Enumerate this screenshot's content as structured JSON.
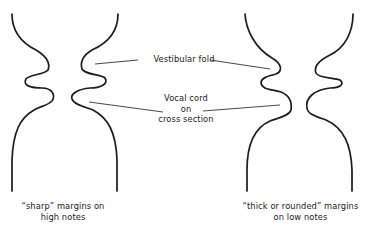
{
  "diagram": {
    "labels": {
      "vestibular_fold": "Vestibular fold",
      "vocal_cord_line1": "Vocal cord",
      "vocal_cord_line2": "on",
      "vocal_cord_line3": "cross section"
    },
    "figures": [
      {
        "id": "high-notes",
        "caption_line1": "“sharp” margins on",
        "caption_line2": "high notes"
      },
      {
        "id": "low-notes",
        "caption_line1": "“thick or rounded” margins",
        "caption_line2": "on low notes"
      }
    ],
    "colors": {
      "stroke": "#1c1c1c",
      "background": "#ffffff"
    }
  }
}
